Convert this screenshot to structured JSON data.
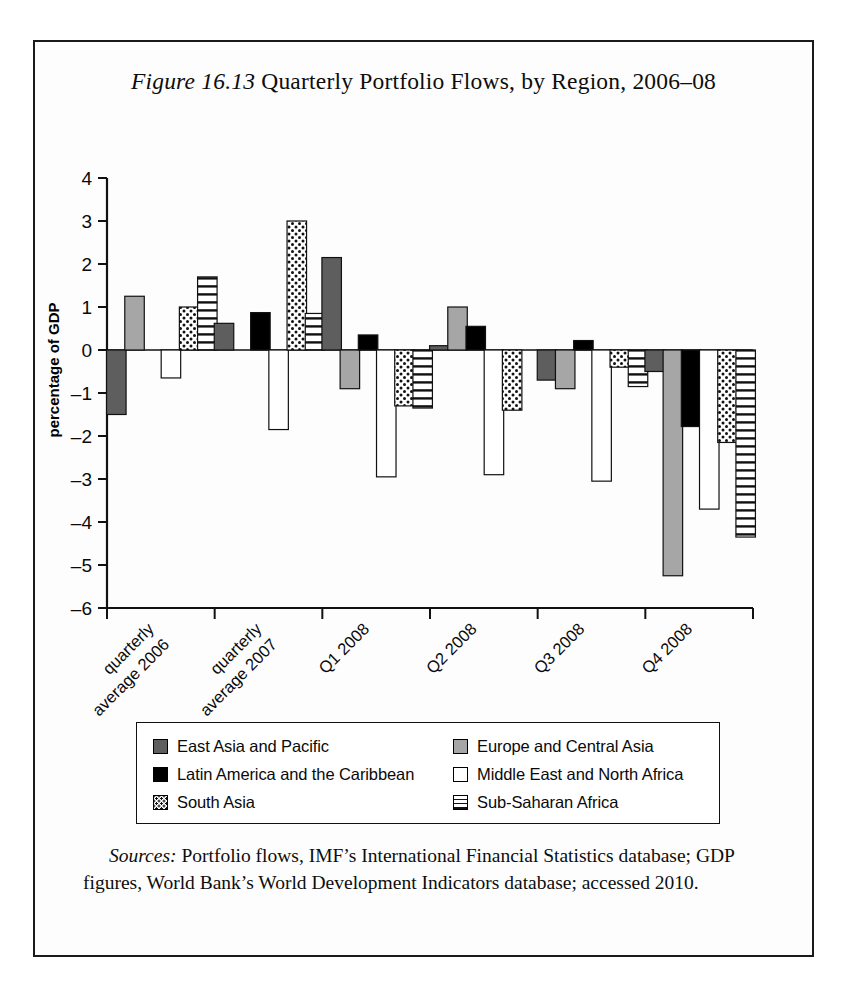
{
  "figure": {
    "label": "Figure 16.13",
    "title_rest": " Quarterly Portfolio Flows, by Region, 2006–08"
  },
  "sources": {
    "label": "Sources:",
    "text": " Portfolio flows, IMF’s International Financial Statistics database; GDP figures, World Bank’s World Development Indicators database; accessed 2010."
  },
  "legend": {
    "items": [
      {
        "label": "East Asia and Pacific",
        "swatch": "sw-darkgray",
        "pattern": "solid-dark-gray"
      },
      {
        "label": "Europe and Central Asia",
        "swatch": "sw-midgray",
        "pattern": "solid-mid-gray"
      },
      {
        "label": "Latin America and the Caribbean",
        "swatch": "sw-black",
        "pattern": "solid-black"
      },
      {
        "label": "Middle East and North Africa",
        "swatch": "sw-white",
        "pattern": "solid-white"
      },
      {
        "label": "South Asia",
        "swatch": "sw-dots",
        "pattern": "dotted"
      },
      {
        "label": "Sub-Saharan Africa",
        "swatch": "sw-hlines",
        "pattern": "horizontal-lines"
      }
    ]
  },
  "chart_data": {
    "type": "bar",
    "title": "Figure 16.13 Quarterly Portfolio Flows, by Region, 2006–08",
    "xlabel": "",
    "ylabel": "percentage of GDP",
    "ylim": [
      -6,
      4
    ],
    "yticks": [
      4,
      3,
      2,
      1,
      0,
      -1,
      -2,
      -3,
      -4,
      -5,
      -6
    ],
    "ytick_labels": [
      "4",
      "3",
      "2",
      "1",
      "0",
      "–1",
      "–2",
      "–3",
      "–4",
      "–5",
      "–6"
    ],
    "grid": false,
    "legend_position": "bottom",
    "categories": [
      "quarterly average 2006",
      "quarterly average 2007",
      "Q1 2008",
      "Q2 2008",
      "Q3 2008",
      "Q4 2008"
    ],
    "series": [
      {
        "name": "East Asia and Pacific",
        "pattern": "solid-dark-gray",
        "color": "#5e5e5e",
        "values": [
          -1.5,
          0.62,
          2.15,
          0.1,
          -0.7,
          -0.5
        ]
      },
      {
        "name": "Europe and Central Asia",
        "pattern": "solid-mid-gray",
        "color": "#a6a6a6",
        "values": [
          1.25,
          null,
          -0.9,
          1.0,
          -0.9,
          -5.25
        ]
      },
      {
        "name": "Latin America and the Caribbean",
        "pattern": "solid-black",
        "color": "#000000",
        "values": [
          null,
          0.87,
          0.35,
          0.55,
          0.22,
          -1.78
        ]
      },
      {
        "name": "Middle East and North Africa",
        "pattern": "solid-white",
        "color": "#ffffff",
        "values": [
          -0.65,
          -1.85,
          -2.95,
          -2.9,
          -3.05,
          -3.7
        ]
      },
      {
        "name": "South Asia",
        "pattern": "dotted",
        "color": "#ffffff",
        "values": [
          1.0,
          3.0,
          -1.3,
          -1.4,
          -0.4,
          -2.15
        ]
      },
      {
        "name": "Sub-Saharan Africa",
        "pattern": "horizontal-lines",
        "color": "#ffffff",
        "values": [
          1.7,
          0.85,
          -1.35,
          null,
          -0.85,
          -4.35
        ]
      }
    ]
  }
}
